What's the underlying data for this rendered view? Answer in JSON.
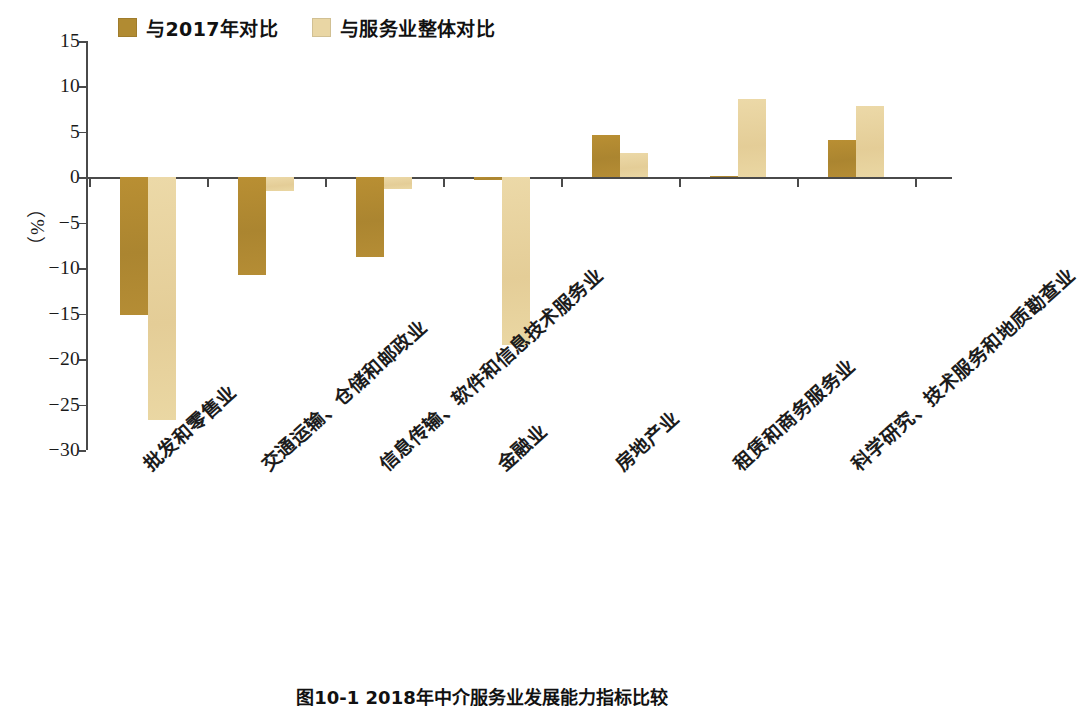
{
  "chart_data": {
    "type": "bar",
    "title": "图10-1 2018年中介服务业发展能力指标比较",
    "xlabel": "",
    "ylabel": "（%）",
    "ylim": [
      -30,
      15
    ],
    "yticks": [
      15,
      10,
      5,
      0,
      -5,
      -10,
      -15,
      -20,
      -25,
      -30
    ],
    "ytick_labels": [
      "15",
      "10",
      "5",
      "0",
      "−5",
      "−10",
      "−15",
      "−20",
      "−25",
      "−30"
    ],
    "grid": false,
    "legend_position": "top-left",
    "categories": [
      "批发和零售业",
      "交通运输、仓储和邮政业",
      "信息传输、软件和信息技术服务业",
      "金融业",
      "房地产业",
      "租赁和商务服务业",
      "科学研究、技术服务和地质勘查业"
    ],
    "series": [
      {
        "name": "与2017年对比",
        "color": "#b18b32",
        "values": [
          -15.1,
          -10.8,
          -8.8,
          -0.3,
          4.7,
          0.2,
          4.1
        ]
      },
      {
        "name": "与服务业整体对比",
        "color": "#e9d6a4",
        "values": [
          -26.7,
          -1.5,
          -1.3,
          -18.5,
          2.7,
          8.6,
          7.9
        ]
      }
    ]
  },
  "legend": {
    "items": [
      {
        "label": "与2017年对比",
        "color": "#b18b32"
      },
      {
        "label": "与服务业整体对比",
        "color": "#e9d6a4"
      }
    ]
  },
  "axis": {
    "y_title": "（%）"
  },
  "caption": {
    "text": "图10-1 2018年中介服务业发展能力指标比较"
  }
}
